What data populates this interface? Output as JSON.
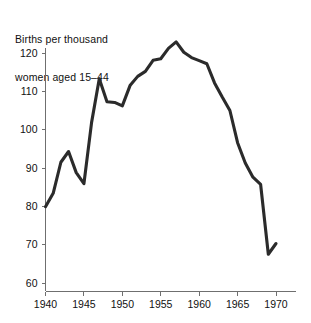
{
  "chart_data": {
    "type": "line",
    "title": "Births per thousand women aged 15–44",
    "title_line1": "Births per thousand",
    "title_line2": "women aged 15–44",
    "xlabel": "",
    "ylabel": "",
    "xlim": [
      1939,
      1971
    ],
    "ylim": [
      57,
      124
    ],
    "grid": false,
    "legend": null,
    "line_color": "#2b2b2b",
    "axis_color": "#6f6f6f",
    "background_color": "#ffffff",
    "xticks": [
      1940,
      1945,
      1950,
      1955,
      1960,
      1965,
      1970
    ],
    "xtick_labels": [
      "1940",
      "1945",
      "1950",
      "1955",
      "1960",
      "1965",
      "1970"
    ],
    "yticks": [
      60,
      70,
      80,
      90,
      100,
      110,
      120
    ],
    "ytick_labels": [
      "60",
      "70",
      "80",
      "90",
      "100",
      "110",
      "120"
    ],
    "x": [
      1940,
      1941,
      1942,
      1943,
      1944,
      1945,
      1946,
      1947,
      1948,
      1949,
      1950,
      1951,
      1952,
      1953,
      1954,
      1955,
      1956,
      1957,
      1958,
      1959,
      1960,
      1961,
      1962,
      1963,
      1964,
      1965,
      1966,
      1967,
      1968,
      1969,
      1970
    ],
    "values": [
      79.9,
      83.4,
      91.5,
      94.3,
      88.8,
      85.9,
      101.9,
      113.3,
      107.3,
      107.1,
      106.2,
      111.5,
      113.9,
      115.2,
      118.1,
      118.5,
      121.2,
      122.9,
      120.2,
      118.8,
      118.0,
      117.2,
      112.2,
      108.5,
      105.0,
      96.6,
      91.3,
      87.6,
      85.7,
      67.5,
      70.3
    ],
    "series": [
      {
        "name": "Births per thousand women aged 15-44",
        "values": [
          79.9,
          83.4,
          91.5,
          94.3,
          88.8,
          85.9,
          101.9,
          113.3,
          107.3,
          107.1,
          106.2,
          111.5,
          113.9,
          115.2,
          118.1,
          118.5,
          121.2,
          122.9,
          120.2,
          118.8,
          118.0,
          117.2,
          112.2,
          108.5,
          105.0,
          96.6,
          91.3,
          87.6,
          85.7,
          67.5,
          70.3
        ]
      }
    ]
  }
}
